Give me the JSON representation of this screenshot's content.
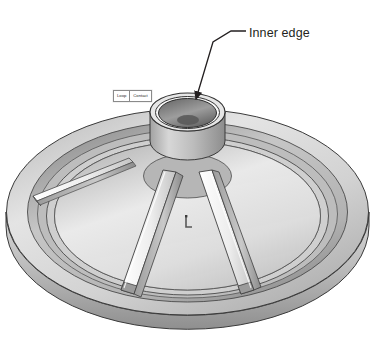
{
  "document": {
    "title_clipped": "",
    "background_color": "#ffffff"
  },
  "annotations": [
    {
      "id": "inner-edge",
      "label": "Inner edge",
      "label_color": "#231f20",
      "leader": {
        "style": "arrow",
        "text_anchor": {
          "x": 246,
          "y": 31
        },
        "elbow": {
          "x": 231,
          "y": 31
        },
        "bend": {
          "x": 213,
          "y": 42
        },
        "tip": {
          "x": 194,
          "y": 101
        }
      }
    }
  ],
  "tooltip": {
    "name": "loop-contact-tooltip",
    "cells": [
      "Loop",
      "Contact"
    ],
    "border_color": "#8a8a8a",
    "background": "#ffffff"
  },
  "viewport_triad": {
    "name": "coordinate-axes-marker",
    "visible": true,
    "color": "#585858"
  },
  "model": {
    "name": "circular-disc-with-hub-and-ribs",
    "description": "Isometric shaded CAD view of a round dished plate with a central cylindrical boss, a counterbored inner edge, three radial ribs and a wide outer rim.",
    "shading": {
      "outline": "#3a3a3a",
      "highlight": "#f4f4f4",
      "light_face": "#e2e2e2",
      "mid_face": "#c9c9c9",
      "dark_face": "#9e9e9e",
      "shadow_face": "#7e7e7e",
      "bore_dark": "#6f6f6f",
      "bore_darkest": "#4d4d4d"
    },
    "features": [
      {
        "name": "outer-rim",
        "type": "annular-band"
      },
      {
        "name": "rim-groove",
        "type": "recessed-channel"
      },
      {
        "name": "dish-floor",
        "type": "conical-surface"
      },
      {
        "name": "central-hub",
        "type": "cylindrical-boss"
      },
      {
        "name": "inner-edge",
        "type": "bore-top-rim"
      },
      {
        "name": "rib-left",
        "type": "radial-rib"
      },
      {
        "name": "rib-right",
        "type": "radial-rib"
      },
      {
        "name": "rib-rear-left",
        "type": "radial-rib"
      }
    ]
  }
}
